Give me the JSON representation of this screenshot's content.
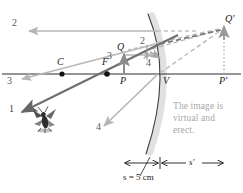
{
  "figure": {
    "type": "ray-diagram"
  },
  "axis_points": [
    {
      "name": "C",
      "label": "C",
      "x": 62,
      "y": 74,
      "dot": true
    },
    {
      "name": "F",
      "label": "F",
      "x": 107,
      "y": 74,
      "dot": true
    },
    {
      "name": "P",
      "label": "P",
      "x": 124,
      "y": 74,
      "dot": false
    },
    {
      "name": "V",
      "label": "V",
      "x": 160,
      "y": 74,
      "dot": false
    },
    {
      "name": "P'",
      "label": "P'",
      "x": 224,
      "y": 74,
      "dot": false
    }
  ],
  "object": {
    "label": "Q",
    "tip_x": 124,
    "tip_y": 55,
    "base_x": 124,
    "base_y": 74,
    "color": "#8c8c8c"
  },
  "image": {
    "label": "Q'",
    "tip_x": 224,
    "tip_y": 27,
    "base_x": 224,
    "base_y": 74,
    "color": "#9a9a9a"
  },
  "rays": [
    {
      "id": "1",
      "label": "1",
      "label_x": 9,
      "label_y": 110,
      "color": "#6b6b6b",
      "style": "solid",
      "note": "incident ray toward mirror through F direction"
    },
    {
      "id": "2a",
      "label": "2",
      "label_x": 12,
      "label_y": 24,
      "color": "#b5b5b5",
      "style": "solid",
      "note": "reflected ray parallel to axis going left"
    },
    {
      "id": "2b",
      "label": "2",
      "label_x": 141,
      "label_y": 43,
      "color": "#b5b5b5",
      "style": "solid",
      "note": "incident parallel ray"
    },
    {
      "id": "3a",
      "label": "3",
      "label_x": 7,
      "label_y": 82,
      "color": "#b5b5b5",
      "style": "solid",
      "note": "reflected ray through C direction"
    },
    {
      "id": "3b",
      "label": "3",
      "label_x": 116,
      "label_y": 52,
      "color": "#b5b5b5",
      "style": "solid",
      "note": "incident ray aimed at C"
    },
    {
      "id": "4a",
      "label": "4",
      "label_x": 96,
      "label_y": 128,
      "color": "#b5b5b5",
      "style": "solid",
      "note": "reflected ray off vertex"
    },
    {
      "id": "4b",
      "label": "4",
      "label_x": 147,
      "label_y": 63,
      "color": "#9e9e9e",
      "style": "solid",
      "note": "incident ray to vertex"
    }
  ],
  "mirror": {
    "name": "convex-mirror",
    "color": "#4a4a4a",
    "glow_color": "#d8d8d8"
  },
  "object_figure": {
    "name": "fly",
    "x": 45,
    "y": 118
  },
  "note": {
    "line1": "The image is",
    "line2": "virtual and",
    "line3": "erect."
  },
  "scale": {
    "s_label": "s = 5 cm",
    "s_value": "5",
    "s_unit": "cm",
    "s_prime_label": "s'",
    "left_x": 124,
    "mid_x": 160,
    "right_x": 224,
    "y": 163
  },
  "colors": {
    "axis": "#2a2a2a",
    "object_gray": "#8c8c8c",
    "ray_light": "#bdbdbd",
    "ray_dark": "#6b6b6b",
    "dashed": "#b0b0b0",
    "note_text": "#a8a8a8",
    "background": "#ffffff"
  }
}
